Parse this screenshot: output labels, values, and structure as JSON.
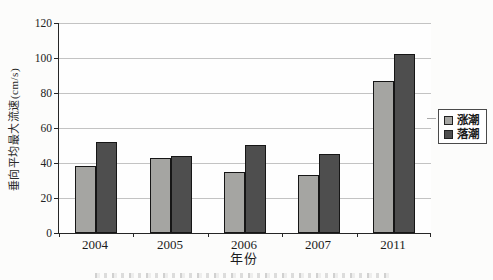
{
  "figure": {
    "background": "#fcfcfb",
    "gridline_color": "#c3c3c3",
    "axis_color": "#262626"
  },
  "chart_data": {
    "type": "bar",
    "categories": [
      "2004",
      "2005",
      "2006",
      "2007",
      "2011"
    ],
    "series": [
      {
        "name": "涨潮",
        "color": "#a5a5a2",
        "values": [
          38,
          43,
          35,
          33,
          87
        ]
      },
      {
        "name": "落潮",
        "color": "#4e4e4e",
        "values": [
          52,
          44,
          50,
          45,
          102
        ]
      }
    ],
    "title": "",
    "xlabel": "年份",
    "ylabel": "垂向平均最大流速(cm/s)",
    "ylim": [
      0,
      120
    ],
    "yticks": [
      0,
      20,
      40,
      60,
      80,
      100,
      120
    ],
    "grid": true,
    "legend_position": "right"
  }
}
